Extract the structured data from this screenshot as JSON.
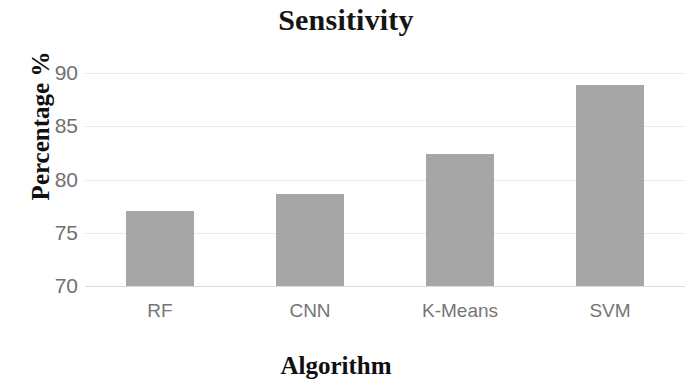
{
  "chart_data": {
    "type": "bar",
    "title": "Sensitivity",
    "xlabel": "Algorithm",
    "ylabel": "Percentage %",
    "categories": [
      "RF",
      "CNN",
      "K-Means",
      "SVM"
    ],
    "values": [
      77.0,
      78.6,
      82.4,
      88.9
    ],
    "ylim": [
      70,
      90
    ],
    "yticks": [
      70,
      75,
      80,
      85,
      90
    ],
    "ytick_labels": [
      "70",
      "75",
      "80",
      "85",
      "90"
    ],
    "grid": true,
    "legend": null,
    "bar_color": "#a6a6a6",
    "grid_color": "#e9e9e9",
    "title_color": "#151515",
    "tick_label_color": "#707070"
  }
}
